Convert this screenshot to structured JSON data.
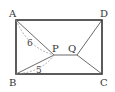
{
  "diagram": {
    "type": "geometry",
    "points": {
      "A": {
        "label": "A"
      },
      "B": {
        "label": "B"
      },
      "C": {
        "label": "C"
      },
      "D": {
        "label": "D"
      },
      "P": {
        "label": "P"
      },
      "Q": {
        "label": "Q"
      }
    },
    "segments": [
      [
        "A",
        "B"
      ],
      [
        "B",
        "C"
      ],
      [
        "C",
        "D"
      ],
      [
        "D",
        "A"
      ],
      [
        "A",
        "P"
      ],
      [
        "B",
        "P"
      ],
      [
        "P",
        "Q"
      ],
      [
        "Q",
        "D"
      ],
      [
        "Q",
        "C"
      ]
    ],
    "measurements": [
      {
        "from": "A",
        "to": "P",
        "value": "6"
      },
      {
        "from": "B",
        "to": "P",
        "value": "5"
      }
    ],
    "colors": {
      "stroke": "#333333",
      "dashed": "#999999",
      "background": "#ffffff"
    }
  }
}
